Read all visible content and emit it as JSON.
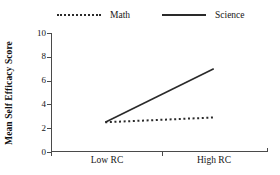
{
  "legend": {
    "position": "top",
    "entries": [
      {
        "label": "Math",
        "style": "dotted",
        "icon": "dotted-line-icon"
      },
      {
        "label": "Science",
        "style": "solid",
        "icon": "solid-line-icon"
      }
    ]
  },
  "axes": {
    "ylabel": "Mean Self Efficacy Score",
    "xlabel": "",
    "yticks": [
      "10",
      "8",
      "6",
      "4",
      "2",
      "0"
    ],
    "xticks": [
      "Low RC",
      "High RC"
    ]
  },
  "colors": {
    "line": "#2a2a2a",
    "axis": "#4a4a4a",
    "text": "#161616",
    "background": "#ffffff"
  },
  "chart_data": {
    "type": "line",
    "title": "",
    "xlabel": "",
    "ylabel": "Mean Self Efficacy Score",
    "categories": [
      "Low RC",
      "High RC"
    ],
    "ylim": [
      0,
      10
    ],
    "ytick_values": [
      0,
      2,
      4,
      6,
      8,
      10
    ],
    "grid": false,
    "legend_position": "top",
    "series": [
      {
        "name": "Math",
        "values": [
          2.5,
          2.9
        ],
        "style": "dotted"
      },
      {
        "name": "Science",
        "values": [
          2.5,
          7.0
        ],
        "style": "solid"
      }
    ]
  }
}
